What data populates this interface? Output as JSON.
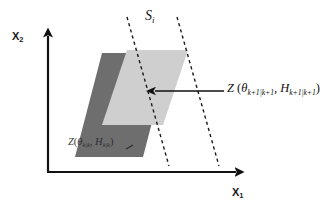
{
  "figure": {
    "type": "geometric-set-diagram",
    "background_color": "#ffffff"
  },
  "axes": {
    "x_axis": {
      "name": "horizontal-axis",
      "label": "X",
      "label_sub": "1",
      "arrow": "right"
    },
    "y_axis": {
      "name": "vertical-axis",
      "label": "X",
      "label_sub": "2",
      "arrow": "up"
    },
    "axis_color": "#111111"
  },
  "strip": {
    "label": "S",
    "label_sub": "i",
    "line_style": "dashed",
    "line_color": "#1b1b1b",
    "count": 2
  },
  "sets": {
    "prior": {
      "name": "prior-set",
      "fill_color": "#6e6e6e",
      "label_Z": "Z",
      "label_open": "(",
      "label_theta": "θ",
      "label_theta_sub": "k|k",
      "label_comma": ", ",
      "label_H": "H",
      "label_H_sub": "k|k",
      "label_close": ")"
    },
    "updated": {
      "name": "updated-set",
      "fill_color": "#cfcfcf",
      "label_Z": "Z",
      "label_open": " (",
      "label_theta": "θ",
      "label_theta_sub": "k+1|k+1",
      "label_comma": ", ",
      "label_H": "H",
      "label_H_sub": "k+1|k+1",
      "label_close": ")"
    }
  },
  "annotation": {
    "arrow": {
      "name": "callout-arrow",
      "direction": "left",
      "color": "#111111"
    }
  }
}
